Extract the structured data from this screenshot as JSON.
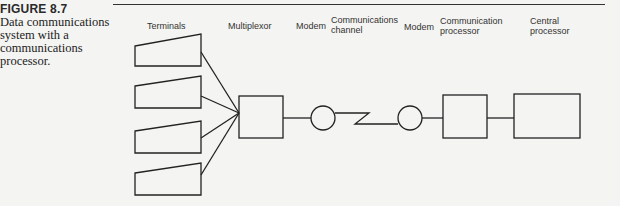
{
  "caption": {
    "figure_number": "FIGURE 8.7",
    "text": "Data communications system with a communications processor."
  },
  "labels": {
    "terminals": "Terminals",
    "multiplexor": "Multiplexor",
    "modem1": "Modem",
    "channel": "Communications channel",
    "modem2": "Modem",
    "comm_processor": "Communication processor",
    "central_processor": "Central processor"
  },
  "diagram": {
    "nodes": [
      "Terminal 1",
      "Terminal 2",
      "Terminal 3",
      "Terminal 4",
      "Multiplexor",
      "Modem",
      "Communications channel",
      "Modem",
      "Communication processor",
      "Central processor"
    ],
    "edges": [
      [
        "Terminal 1",
        "Multiplexor"
      ],
      [
        "Terminal 2",
        "Multiplexor"
      ],
      [
        "Terminal 3",
        "Multiplexor"
      ],
      [
        "Terminal 4",
        "Multiplexor"
      ],
      [
        "Multiplexor",
        "Modem"
      ],
      [
        "Modem",
        "Communications channel"
      ],
      [
        "Communications channel",
        "Modem"
      ],
      [
        "Modem",
        "Communication processor"
      ],
      [
        "Communication processor",
        "Central processor"
      ]
    ]
  }
}
